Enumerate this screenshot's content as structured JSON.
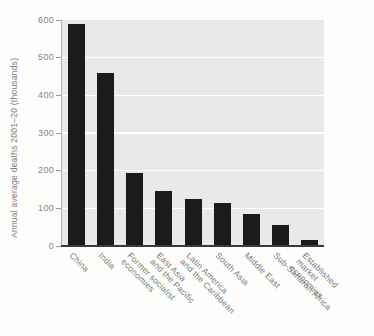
{
  "chart_data": {
    "type": "bar",
    "title": "",
    "xlabel": "",
    "ylabel": "Annual average deaths 2001–20 (thousands)",
    "ylim": [
      0,
      600
    ],
    "yticks": [
      0,
      100,
      200,
      300,
      400,
      500,
      600
    ],
    "grid": "horizontal white gridlines on light-gray plot background",
    "legend": "none",
    "categories": [
      "China",
      "India",
      "Former socialist\neconomies",
      "East Asia\nand the Pacific",
      "Latin America\nand the Caribbean",
      "South Asia",
      "Middle East",
      "Sub-Saharan Africa",
      "Established\nmarket economies"
    ],
    "values": [
      590,
      460,
      195,
      145,
      125,
      115,
      85,
      55,
      15
    ],
    "colors": {
      "bar": "#1b1b1b",
      "plot_background": "#e9e9e7",
      "gridline": "#ffffff",
      "baseline": "#3a3a3a",
      "axis_line": "#b2b2af",
      "text": "#7e7e7e"
    }
  }
}
